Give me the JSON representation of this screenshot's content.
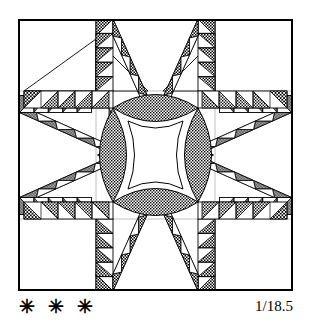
{
  "figure": {
    "name": "feathered-star-quilt-block",
    "background_color": "#ffffff",
    "line_color": "#000000",
    "frame": {
      "x": 0,
      "y": 0,
      "width": 275,
      "height": 272,
      "stroke_width": 2.0
    }
  },
  "caption": {
    "stars": "✳ ✳ ✳",
    "reference": "1/18.5"
  },
  "palette": {
    "ink": "#000000",
    "paper": "#ffffff",
    "guide": "#9a9a9a",
    "fill_checker": "#000000",
    "fill_dot": "#000000"
  },
  "geometry": {
    "grid_unit": 17.0,
    "band_width": 17.0,
    "center_x": 137.5,
    "center_y": 136.0,
    "arm_inner": 103.0,
    "arm_outer": 170.0,
    "vertical_strip_left_x": 78.0,
    "vertical_strip_right_x": 197.0,
    "horizontal_strip_top_y": 72.0,
    "horizontal_strip_bottom_y": 200.0,
    "petal_half_length": 52.0,
    "petal_half_width": 19.0,
    "sawtooth_teeth_per_band": 5,
    "star_points": 8
  },
  "elements": {
    "outer_frame_label": "block-outline",
    "corner_squares_label": "plain-corner-square",
    "vertical_strip_label": "vertical-sawtooth-strip",
    "horizontal_strip_label": "horizontal-sawtooth-strip",
    "diagonal_band_label": "diagonal-sawtooth-band",
    "star_point_label": "star-point",
    "petal_label": "center-petal",
    "center_label": "center-concave-square"
  },
  "legend_notes": {
    "texture_checker": "cross-hatch checkerboard fill",
    "texture_dot": "fine stipple dot fill",
    "texture_plain": "unfilled white patch"
  }
}
